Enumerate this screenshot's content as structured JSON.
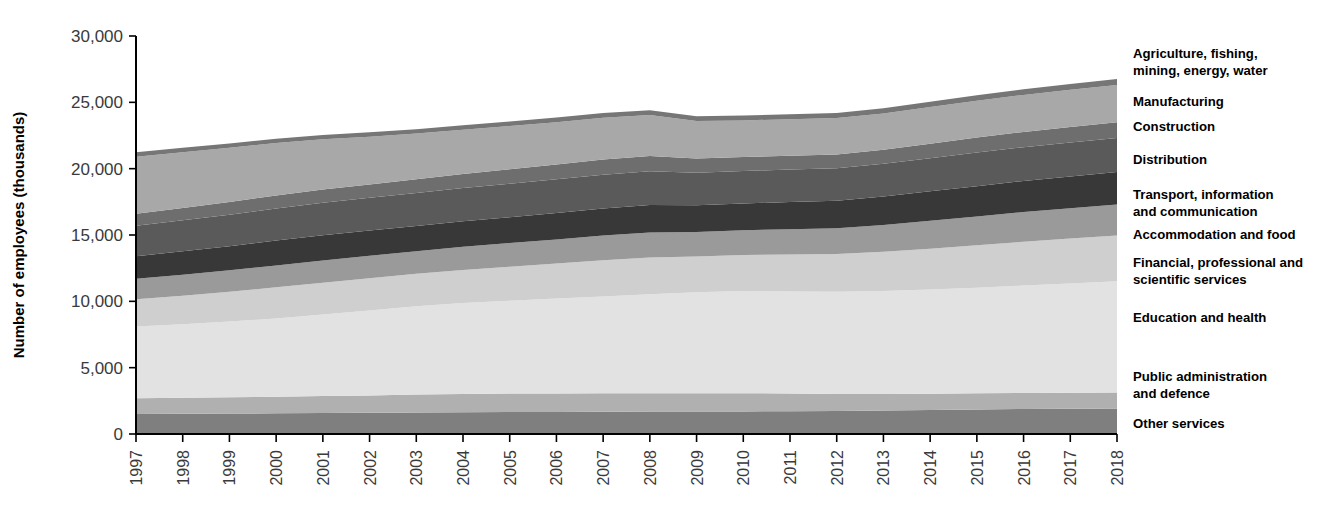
{
  "chart_data": {
    "type": "area",
    "stacked": true,
    "title": "",
    "subtitle": "",
    "xlabel": "",
    "ylabel": "Number of employees (thousands)",
    "ylim": [
      0,
      30000
    ],
    "yticks": [
      0,
      5000,
      10000,
      15000,
      20000,
      25000,
      30000
    ],
    "ytick_labels": [
      "0",
      "5,000",
      "10,000",
      "15,000",
      "20,000",
      "25,000",
      "30,000"
    ],
    "grid": false,
    "legend_position": "right",
    "x": [
      1997,
      1998,
      1999,
      2000,
      2001,
      2002,
      2003,
      2004,
      2005,
      2006,
      2007,
      2008,
      2009,
      2010,
      2011,
      2012,
      2013,
      2014,
      2015,
      2016,
      2017,
      2018
    ],
    "xtick_labels": [
      "1997",
      "1998",
      "1999",
      "2000",
      "2001",
      "2002",
      "2003",
      "2004",
      "2005",
      "2006",
      "2007",
      "2008",
      "2009",
      "2010",
      "2011",
      "2012",
      "2013",
      "2014",
      "2015",
      "2016",
      "2017",
      "2018"
    ],
    "series": [
      {
        "name": "Other services",
        "color": "#7f7f7f",
        "values": [
          1500,
          1520,
          1545,
          1560,
          1580,
          1600,
          1620,
          1640,
          1650,
          1660,
          1680,
          1700,
          1690,
          1700,
          1720,
          1740,
          1770,
          1810,
          1850,
          1880,
          1900,
          1920
        ]
      },
      {
        "name": "Public administration and defence",
        "color": "#b0b0b0",
        "values": [
          1200,
          1210,
          1230,
          1250,
          1280,
          1310,
          1350,
          1380,
          1400,
          1400,
          1390,
          1380,
          1390,
          1380,
          1330,
          1280,
          1250,
          1230,
          1220,
          1210,
          1200,
          1200
        ]
      },
      {
        "name": "Education and health",
        "color": "#e2e2e2",
        "values": [
          5400,
          5550,
          5700,
          5900,
          6150,
          6400,
          6650,
          6850,
          7000,
          7150,
          7300,
          7450,
          7600,
          7700,
          7700,
          7700,
          7750,
          7850,
          7950,
          8100,
          8250,
          8400
        ]
      },
      {
        "name": "Financial, professional and scientific services",
        "color": "#cfcfcf",
        "values": [
          2050,
          2150,
          2250,
          2350,
          2400,
          2430,
          2450,
          2500,
          2560,
          2640,
          2730,
          2780,
          2700,
          2720,
          2780,
          2840,
          2960,
          3080,
          3200,
          3300,
          3380,
          3450
        ]
      },
      {
        "name": "Accommodation and food",
        "color": "#9a9a9a",
        "values": [
          1550,
          1580,
          1610,
          1640,
          1670,
          1690,
          1710,
          1740,
          1780,
          1820,
          1860,
          1880,
          1840,
          1860,
          1900,
          1950,
          2030,
          2110,
          2180,
          2240,
          2290,
          2330
        ]
      },
      {
        "name": "Transport, information and communication",
        "color": "#383838",
        "values": [
          1700,
          1760,
          1820,
          1880,
          1900,
          1900,
          1900,
          1920,
          1950,
          1990,
          2040,
          2080,
          2020,
          2020,
          2050,
          2080,
          2140,
          2210,
          2280,
          2340,
          2390,
          2440
        ]
      },
      {
        "name": "Distribution",
        "color": "#5a5a5a",
        "values": [
          2300,
          2340,
          2380,
          2420,
          2450,
          2470,
          2490,
          2510,
          2530,
          2540,
          2550,
          2540,
          2460,
          2450,
          2450,
          2450,
          2470,
          2500,
          2530,
          2550,
          2570,
          2580
        ]
      },
      {
        "name": "Construction",
        "color": "#6e6e6e",
        "values": [
          900,
          930,
          960,
          980,
          1000,
          1010,
          1030,
          1060,
          1090,
          1120,
          1150,
          1150,
          1060,
          1040,
          1040,
          1030,
          1050,
          1090,
          1130,
          1150,
          1170,
          1180
        ]
      },
      {
        "name": "Manufacturing",
        "color": "#a8a8a8",
        "values": [
          4300,
          4200,
          4080,
          3950,
          3780,
          3600,
          3450,
          3340,
          3250,
          3180,
          3130,
          3080,
          2830,
          2770,
          2760,
          2740,
          2740,
          2760,
          2780,
          2790,
          2800,
          2810
        ]
      },
      {
        "name": "Agriculture, fishing, mining, energy, water",
        "color": "#767676",
        "values": [
          330,
          330,
          330,
          330,
          330,
          330,
          330,
          330,
          340,
          350,
          360,
          370,
          360,
          360,
          370,
          380,
          390,
          400,
          410,
          420,
          430,
          440
        ]
      }
    ],
    "legend_entries": [
      {
        "label": "Agriculture, fishing,",
        "label2": "mining, energy, water",
        "y": 58
      },
      {
        "label": "Manufacturing",
        "label2": "",
        "y": 106
      },
      {
        "label": "Construction",
        "label2": "",
        "y": 131
      },
      {
        "label": "Distribution",
        "label2": "",
        "y": 164
      },
      {
        "label": "Transport, information",
        "label2": "and communication",
        "y": 199
      },
      {
        "label": "Accommodation and food",
        "label2": "",
        "y": 239
      },
      {
        "label": "Financial, professional and",
        "label2": "scientific services",
        "y": 267
      },
      {
        "label": "Education and health",
        "label2": "",
        "y": 322
      },
      {
        "label": "Public administration",
        "label2": "and defence",
        "y": 381
      },
      {
        "label": "Other services",
        "label2": "",
        "y": 428
      }
    ]
  }
}
